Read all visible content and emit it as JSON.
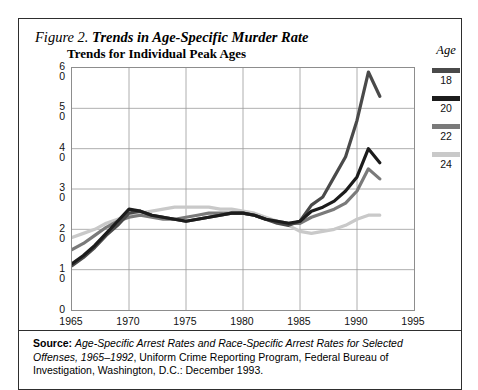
{
  "figure": {
    "number_label": "Figure 2.",
    "title": "Trends in Age-Specific Murder Rate",
    "subtitle": "Trends for Individual Peak Ages"
  },
  "legend": {
    "title": "Age",
    "items": [
      {
        "label": "18",
        "color": "#4a4a4a"
      },
      {
        "label": "20",
        "color": "#1c1c1c"
      },
      {
        "label": "22",
        "color": "#7a7a7a"
      },
      {
        "label": "24",
        "color": "#c9c9c9"
      }
    ]
  },
  "source": {
    "prefix": "Source:",
    "italic_part": "Age-Specific Arrest Rates and Race-Specific Arrest Rates for Selected Offenses, 1965–1992",
    "rest": ", Uniform Crime Reporting Program, Federal Bureau of Investigation, Washington, D.C.: December 1993."
  },
  "chart_data": {
    "type": "line",
    "title": "Trends in Age-Specific Murder Rate",
    "subtitle": "Trends for Individual Peak Ages",
    "xlabel": "",
    "ylabel": "Rate per 100,000 Population",
    "xlim": [
      1965,
      1995
    ],
    "ylim": [
      0,
      60
    ],
    "xticks": [
      "1965",
      "1970",
      "1975",
      "1980",
      "1985",
      "1990",
      "1995"
    ],
    "yticks": [
      "0",
      "10",
      "20",
      "30",
      "40",
      "50",
      "60"
    ],
    "grid": true,
    "legend_position": "right",
    "legend_title": "Age",
    "x": [
      1965,
      1966,
      1967,
      1968,
      1969,
      1970,
      1971,
      1972,
      1973,
      1974,
      1975,
      1976,
      1977,
      1978,
      1979,
      1980,
      1981,
      1982,
      1983,
      1984,
      1985,
      1986,
      1987,
      1988,
      1989,
      1990,
      1991,
      1992
    ],
    "series": [
      {
        "name": "18",
        "color": "#4a4a4a",
        "values": [
          11.0,
          13.0,
          15.5,
          18.5,
          21.0,
          24.0,
          24.5,
          23.5,
          23.0,
          22.5,
          22.0,
          22.5,
          23.0,
          23.5,
          24.0,
          24.0,
          23.5,
          22.5,
          21.5,
          21.0,
          22.0,
          26.0,
          28.0,
          33.0,
          38.0,
          47.0,
          59.0,
          53.0
        ]
      },
      {
        "name": "20",
        "color": "#1c1c1c",
        "values": [
          11.5,
          13.5,
          16.0,
          19.0,
          22.0,
          25.0,
          24.5,
          23.5,
          23.0,
          22.5,
          22.0,
          22.5,
          23.0,
          23.5,
          24.0,
          24.0,
          23.5,
          22.5,
          22.0,
          21.5,
          22.0,
          24.5,
          25.5,
          27.0,
          29.5,
          33.0,
          40.0,
          36.5
        ]
      },
      {
        "name": "22",
        "color": "#7a7a7a",
        "values": [
          15.0,
          16.5,
          18.5,
          20.5,
          22.0,
          23.0,
          23.5,
          23.0,
          22.5,
          22.5,
          23.0,
          23.5,
          24.0,
          24.0,
          24.0,
          24.0,
          23.5,
          22.5,
          22.0,
          21.5,
          21.5,
          23.0,
          24.0,
          25.0,
          26.5,
          29.5,
          35.0,
          32.5
        ]
      },
      {
        "name": "24",
        "color": "#c9c9c9",
        "values": [
          18.0,
          19.0,
          20.0,
          21.5,
          22.5,
          23.5,
          24.0,
          24.5,
          25.0,
          25.5,
          25.5,
          25.5,
          25.5,
          25.0,
          25.0,
          24.5,
          24.0,
          23.0,
          22.0,
          21.0,
          19.5,
          19.0,
          19.5,
          20.0,
          21.0,
          22.5,
          23.5,
          23.5
        ]
      }
    ]
  }
}
